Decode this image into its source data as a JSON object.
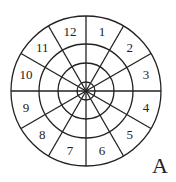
{
  "diagram": {
    "type": "sectored-target",
    "center": [
      86,
      91
    ],
    "radii": [
      75,
      47,
      28,
      9
    ],
    "sectors": 12,
    "sector_labels": [
      "1",
      "2",
      "3",
      "4",
      "5",
      "6",
      "7",
      "8",
      "9",
      "10",
      "11",
      "12"
    ],
    "corner_label": "A",
    "stroke_color": "#222222"
  }
}
